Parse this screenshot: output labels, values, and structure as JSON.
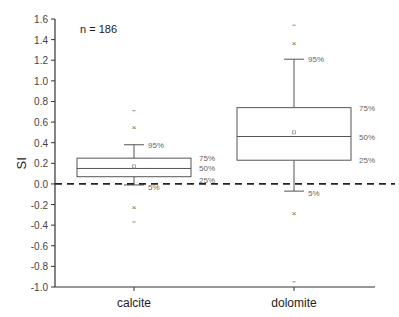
{
  "chart_data": {
    "type": "box",
    "title": "",
    "annotation": "n = 186",
    "xlabel": "",
    "ylabel": "SI",
    "ylim": [
      -1.0,
      1.6
    ],
    "yticks": [
      "1.6",
      "1.4",
      "1.2",
      "1.0",
      "0.8",
      "0.6",
      "0.4",
      "0.2",
      "0.0",
      "-0.2",
      "-0.4",
      "-0.6",
      "-0.8",
      "-1.0"
    ],
    "reference_line": {
      "y": 0.0,
      "style": "dashed"
    },
    "categories": [
      "calcite",
      "dolomite"
    ],
    "series": [
      {
        "name": "calcite",
        "p5": -0.01,
        "p25": 0.07,
        "median": 0.15,
        "p75": 0.25,
        "p95": 0.38,
        "mean": 0.17,
        "outliers_x": [
          0.55,
          -0.22
        ],
        "min": -0.37,
        "max": 0.71,
        "labels": {
          "p95": "95%",
          "p75": "75%",
          "median": "50%",
          "p25": "25%",
          "p5": "5%"
        }
      },
      {
        "name": "dolomite",
        "p5": -0.07,
        "p25": 0.23,
        "median": 0.46,
        "p75": 0.74,
        "p95": 1.21,
        "mean": 0.5,
        "outliers_x": [
          1.37,
          -0.28
        ],
        "min": -0.95,
        "max": 1.54,
        "labels": {
          "p95": "95%",
          "p75": "75%",
          "median": "50%",
          "p25": "25%",
          "p5": "5%"
        }
      }
    ],
    "legend": null,
    "grid": false
  }
}
